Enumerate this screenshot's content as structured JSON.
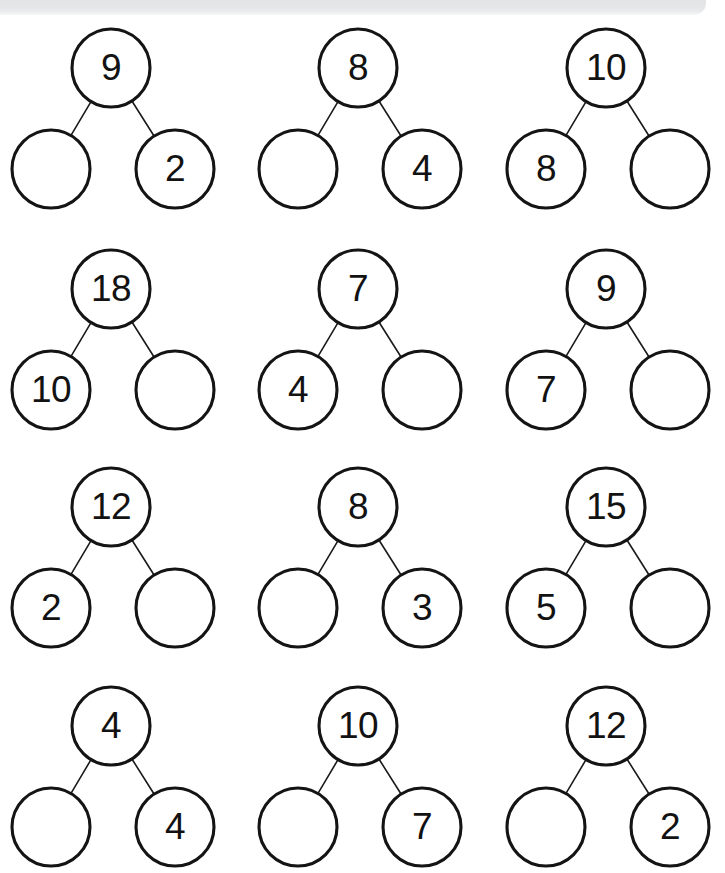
{
  "page": {
    "background_color": "#ffffff",
    "ink_color": "#141414",
    "artifact_bar_color": "#e6e7e9",
    "columns": 3,
    "rows": 4,
    "total_bonds": 12
  },
  "chart_data": {
    "type": "diagram",
    "diagram_type": "number-bond",
    "grid": {
      "columns": 3,
      "rows": 4
    },
    "legend": [],
    "geometry": {
      "circle_diameter": 78,
      "column_centers_x": [
        111,
        358,
        606
      ],
      "row_parent_centers_y": [
        68,
        289,
        507,
        726
      ],
      "child_dx_left": -60,
      "child_dx_right": 64,
      "child_dy": 101
    },
    "bonds": [
      {
        "id": 1,
        "row": 1,
        "col": 1,
        "whole": "9",
        "part_left": "",
        "part_right": "2"
      },
      {
        "id": 2,
        "row": 1,
        "col": 2,
        "whole": "8",
        "part_left": "",
        "part_right": "4"
      },
      {
        "id": 3,
        "row": 1,
        "col": 3,
        "whole": "10",
        "part_left": "8",
        "part_right": ""
      },
      {
        "id": 4,
        "row": 2,
        "col": 1,
        "whole": "18",
        "part_left": "10",
        "part_right": ""
      },
      {
        "id": 5,
        "row": 2,
        "col": 2,
        "whole": "7",
        "part_left": "4",
        "part_right": ""
      },
      {
        "id": 6,
        "row": 2,
        "col": 3,
        "whole": "9",
        "part_left": "7",
        "part_right": ""
      },
      {
        "id": 7,
        "row": 3,
        "col": 1,
        "whole": "12",
        "part_left": "2",
        "part_right": ""
      },
      {
        "id": 8,
        "row": 3,
        "col": 2,
        "whole": "8",
        "part_left": "",
        "part_right": "3"
      },
      {
        "id": 9,
        "row": 3,
        "col": 3,
        "whole": "15",
        "part_left": "5",
        "part_right": ""
      },
      {
        "id": 10,
        "row": 4,
        "col": 1,
        "whole": "4",
        "part_left": "",
        "part_right": "4"
      },
      {
        "id": 11,
        "row": 4,
        "col": 2,
        "whole": "10",
        "part_left": "",
        "part_right": "7"
      },
      {
        "id": 12,
        "row": 4,
        "col": 3,
        "whole": "12",
        "part_left": "",
        "part_right": "2"
      }
    ]
  }
}
